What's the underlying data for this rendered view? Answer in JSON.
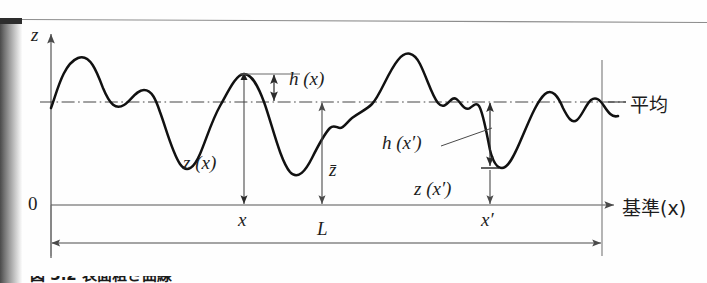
{
  "figure": {
    "kind": "surface-roughness-profile",
    "caption": "図 3.2  表面粗さ曲線",
    "colors": {
      "profile_curve": "#111111",
      "axis": "#555555",
      "dimension_line": "#555555",
      "mean_line": "#444444",
      "text": "#1d1d1d",
      "background": "#fefefe",
      "binding_shadow": "#4a4a4a"
    }
  },
  "axes": {
    "vertical_axis_label": "z",
    "origin_label": "0",
    "horizontal_axis_label": "基準(x)",
    "mean_line_label": "平均"
  },
  "annotations": {
    "h_at_x": "h (x)",
    "h_at_x_prime": "h (x′)",
    "z_at_x": "z (x)",
    "z_at_x_prime": "z (x′)",
    "z_bar": "z̄",
    "x_tick": "x",
    "x_prime_tick": "x′",
    "length_label": "L"
  },
  "chart_data": {
    "type": "line",
    "title": "表面粗さ曲線",
    "xlabel": "基準(x)",
    "ylabel": "z",
    "grid": false,
    "legend": null,
    "reference_lines": [
      {
        "name": "mean-line",
        "label": "平均",
        "style": "dash-dot",
        "y": 102
      },
      {
        "name": "datum-line",
        "label": "基準(x)",
        "style": "solid",
        "y": 205
      }
    ],
    "markers": [
      {
        "name": "x",
        "label": "x",
        "x": 244
      },
      {
        "name": "x-prime",
        "label": "x′",
        "x": 490
      }
    ],
    "dimensions": [
      {
        "name": "h-of-x",
        "label": "h (x)",
        "from_y": 74,
        "to_y": 102,
        "at_x": 274
      },
      {
        "name": "z-of-x",
        "label": "z (x)",
        "from_y": 74,
        "to_y": 205,
        "at_x": 244
      },
      {
        "name": "z-bar",
        "label": "z̄",
        "from_y": 102,
        "to_y": 205,
        "at_x": 322
      },
      {
        "name": "h-of-x-prime",
        "label": "h (x′)",
        "from_y": 102,
        "to_y": 168,
        "at_x": 490
      },
      {
        "name": "z-of-x-prime",
        "label": "z (x′)",
        "from_y": 168,
        "to_y": 205,
        "at_x": 490
      },
      {
        "name": "L",
        "label": "L",
        "from_x": 51,
        "to_x": 602,
        "at_y": 243
      }
    ],
    "profile_path": "M 51,108 C 57,92 63,64 78,58 C 90,53 97,72 103,88 C 110,105 116,110 124,105 C 131,101 136,90 144,90 C 152,90 156,100 160,112 C 166,128 172,152 180,164 C 187,174 194,168 200,154 C 206,140 212,120 220,106 C 228,92 236,74 244,74 C 252,74 258,86 264,102 C 272,124 280,160 290,172 C 298,181 306,170 312,158 C 318,146 324,134 330,128 C 334,124 337,128 340,128 C 344,128 347,122 352,118 C 360,112 366,110 372,104 C 380,96 388,72 398,60 C 406,50 414,52 420,64 C 427,78 432,96 438,103 C 443,109 447,104 451,100 C 455,96 458,100 461,104 C 464,108 467,110 470,108 C 473,106 476,102 479,106 C 483,112 486,130 490,150 C 493,162 497,168 502,168 C 508,168 514,156 520,142 C 528,124 536,102 545,94 C 552,88 558,96 563,108 C 568,118 572,124 577,120 C 582,116 586,104 591,100 C 596,96 600,100 604,106 C 608,112 612,118 618,116"
  }
}
